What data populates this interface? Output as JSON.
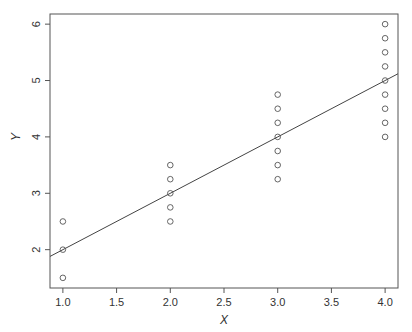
{
  "chart_data": {
    "type": "scatter",
    "title": "",
    "xlabel": "X",
    "ylabel": "Y",
    "xlim": [
      0.88,
      4.12
    ],
    "ylim": [
      1.32,
      6.18
    ],
    "grid": false,
    "legend": null,
    "x_ticks": [
      1.0,
      1.5,
      2.0,
      2.5,
      3.0,
      3.5,
      4.0
    ],
    "x_tick_labels": [
      "1.0",
      "1.5",
      "2.0",
      "2.5",
      "3.0",
      "3.5",
      "4.0"
    ],
    "y_ticks": [
      2,
      3,
      4,
      5,
      6
    ],
    "y_tick_labels": [
      "2",
      "3",
      "4",
      "5",
      "6"
    ],
    "series": [
      {
        "name": "observations",
        "marker": "open-circle",
        "points": [
          [
            1,
            1.5
          ],
          [
            1,
            2.0
          ],
          [
            1,
            2.5
          ],
          [
            2,
            2.5
          ],
          [
            2,
            2.75
          ],
          [
            2,
            3.0
          ],
          [
            2,
            3.25
          ],
          [
            2,
            3.5
          ],
          [
            3,
            3.25
          ],
          [
            3,
            3.5
          ],
          [
            3,
            3.75
          ],
          [
            3,
            4.0
          ],
          [
            3,
            4.25
          ],
          [
            3,
            4.5
          ],
          [
            3,
            4.75
          ],
          [
            4,
            4.0
          ],
          [
            4,
            4.25
          ],
          [
            4,
            4.5
          ],
          [
            4,
            4.75
          ],
          [
            4,
            5.0
          ],
          [
            4,
            5.25
          ],
          [
            4,
            5.5
          ],
          [
            4,
            5.75
          ],
          [
            4,
            6.0
          ]
        ]
      }
    ],
    "fit_line": {
      "type": "linear",
      "intercept": 1.0,
      "slope": 1.0,
      "label": "y = 1 + x"
    }
  },
  "colors": {
    "frame": "#555555",
    "points": "#555555",
    "line": "#444444",
    "text": "#333333"
  }
}
